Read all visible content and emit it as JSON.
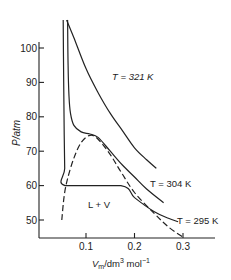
{
  "chart_data": {
    "type": "line",
    "title": "",
    "xlabel": "V_m/dm^3 mol^-1",
    "ylabel": "P/atm",
    "xlim": [
      0.005,
      0.34
    ],
    "ylim": [
      44.8,
      111
    ],
    "xticks": [
      0.1,
      0.2,
      0.3
    ],
    "xtick_labels": [
      "0.1",
      "0.2",
      "0.3"
    ],
    "yticks": [
      50,
      60,
      70,
      80,
      90,
      100
    ],
    "ytick_labels": [
      "50",
      "60",
      "70",
      "80",
      "90",
      "100"
    ],
    "grid": false,
    "legend": null,
    "series": [
      {
        "name": "T = 321 K",
        "style": "solid",
        "points": [
          [
            0.06,
            112
          ],
          [
            0.075,
            103
          ],
          [
            0.1,
            94
          ],
          [
            0.125,
            87
          ],
          [
            0.15,
            81
          ],
          [
            0.175,
            76
          ],
          [
            0.2,
            71
          ],
          [
            0.225,
            67.5
          ],
          [
            0.245,
            65
          ]
        ]
      },
      {
        "name": "T = 304 K",
        "style": "solid",
        "points": [
          [
            0.062,
            111
          ],
          [
            0.063,
            95
          ],
          [
            0.065,
            86
          ],
          [
            0.068,
            81
          ],
          [
            0.075,
            77.5
          ],
          [
            0.09,
            75.6
          ],
          [
            0.108,
            75
          ],
          [
            0.125,
            74
          ],
          [
            0.15,
            70
          ],
          [
            0.175,
            66
          ],
          [
            0.2,
            62.5
          ],
          [
            0.225,
            59
          ],
          [
            0.26,
            55
          ]
        ]
      },
      {
        "name": "T = 295 K",
        "style": "solid",
        "points": [
          [
            0.053,
            111
          ],
          [
            0.054,
            90
          ],
          [
            0.055,
            75
          ],
          [
            0.056,
            65
          ],
          [
            0.057,
            60
          ],
          [
            0.172,
            60
          ],
          [
            0.2,
            56.5
          ],
          [
            0.24,
            52.5
          ],
          [
            0.27,
            50.5
          ],
          [
            0.29,
            49.5
          ]
        ]
      },
      {
        "name": "coexistence boundary",
        "style": "dashed",
        "points": [
          [
            0.05,
            50
          ],
          [
            0.055,
            57
          ],
          [
            0.062,
            62
          ],
          [
            0.075,
            68
          ],
          [
            0.09,
            72.5
          ],
          [
            0.108,
            74.6
          ],
          [
            0.125,
            73.5
          ],
          [
            0.15,
            69
          ],
          [
            0.172,
            64
          ],
          [
            0.2,
            58
          ],
          [
            0.24,
            52
          ],
          [
            0.27,
            48
          ],
          [
            0.3,
            45
          ]
        ]
      }
    ],
    "annotations": [
      {
        "text": "T = 321 K",
        "x": 0.14,
        "y": 88
      },
      {
        "text": "T = 304 K",
        "x": 0.195,
        "y": 60
      },
      {
        "text": "T = 295 K",
        "x": 0.255,
        "y": 51
      },
      {
        "text": "L + V",
        "x": 0.1,
        "y": 55
      }
    ]
  },
  "labels": {
    "y_axis": "P/atm",
    "x_axis_main": "V",
    "x_axis_sub": "m",
    "x_axis_rest": "/dm",
    "x_axis_sup3": "3",
    "x_axis_mol": " mol",
    "x_axis_supm1": "−1",
    "t321": "T = 321 K",
    "t304": "T = 304 K",
    "t295": "T = 295 K",
    "region": "L + V"
  }
}
